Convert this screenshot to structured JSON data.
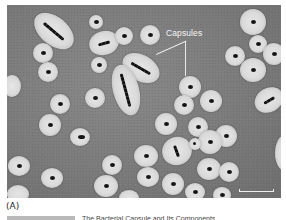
{
  "figure": {
    "panel_label": "(A)",
    "annotation": {
      "text": "Capsules"
    },
    "scale_bar": {
      "label": ""
    },
    "caption_fragment": "The Bacterial Capsule and Its Components"
  },
  "colors": {
    "background": "#7b7b7b",
    "capsule": "#dadada",
    "cell_body": "#151515",
    "annotation": "#f4f4f4"
  }
}
